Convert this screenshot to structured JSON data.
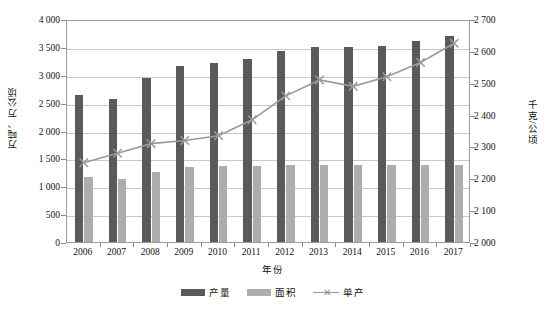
{
  "chart_data": {
    "type": "bar",
    "title": "",
    "xlabel": "年份",
    "ylabel": "万吨、万公顷",
    "y2label": "千克/公顷",
    "grid": true,
    "legend_position": "bottom",
    "categories": [
      "2006",
      "2007",
      "2008",
      "2009",
      "2010",
      "2011",
      "2012",
      "2013",
      "2014",
      "2015",
      "2016",
      "2017"
    ],
    "ylim": [
      0,
      4000
    ],
    "yticks": [
      "0",
      "500",
      "1 000",
      "1 500",
      "2 000",
      "2 500",
      "3 000",
      "3 500",
      "4 000"
    ],
    "ytick_values": [
      0,
      500,
      1000,
      1500,
      2000,
      2500,
      3000,
      3500,
      4000
    ],
    "y2lim": [
      2000,
      2700
    ],
    "y2ticks": [
      "2 000",
      "2 100",
      "2 200",
      "2 300",
      "2 400",
      "2 500",
      "2 600",
      "2 700"
    ],
    "y2tick_values": [
      2000,
      2100,
      2200,
      2300,
      2400,
      2500,
      2600,
      2700
    ],
    "series": [
      {
        "name": "产量",
        "kind": "bar",
        "axis": "left",
        "color": "#5a5a5a",
        "values": [
          2640,
          2560,
          2950,
          3150,
          3210,
          3280,
          3420,
          3500,
          3490,
          3510,
          3600,
          3700
        ]
      },
      {
        "name": "面积",
        "kind": "bar",
        "axis": "left",
        "color": "#adadad",
        "values": [
          1160,
          1130,
          1255,
          1340,
          1370,
          1370,
          1375,
          1385,
          1380,
          1380,
          1385,
          1385
        ]
      },
      {
        "name": "单产",
        "kind": "line",
        "axis": "right",
        "color": "#9a9a9a",
        "marker": "x-marker",
        "values": [
          2255,
          2285,
          2315,
          2325,
          2340,
          2390,
          2465,
          2515,
          2495,
          2525,
          2570,
          2630
        ]
      }
    ]
  },
  "legend": {
    "items": [
      {
        "label": "产量",
        "swatch": "bar-swatch-dark"
      },
      {
        "label": "面积",
        "swatch": "bar-swatch-light"
      },
      {
        "label": "单产",
        "swatch": "line-swatch"
      }
    ]
  },
  "caption": ""
}
